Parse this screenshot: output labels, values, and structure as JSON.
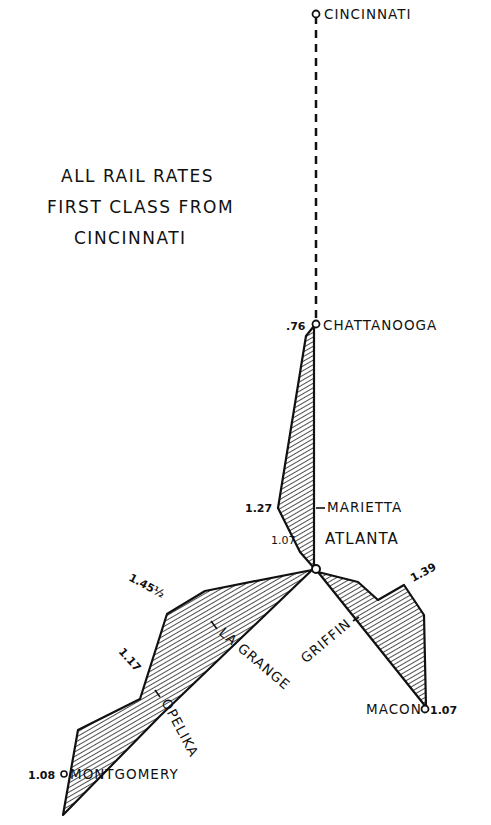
{
  "title": {
    "lines": [
      "ALL RAIL RATES",
      "FIRST CLASS FROM",
      "CINCINNATI"
    ]
  },
  "cities": {
    "cincinnati": {
      "name": "CINCINNATI"
    },
    "chattanooga": {
      "name": "CHATTANOOGA",
      "rate": ".76"
    },
    "marietta": {
      "name": "MARIETTA",
      "rate": "1.27"
    },
    "atlanta": {
      "name": "ATLANTA",
      "rate": "1.07"
    },
    "la_grange": {
      "name": "LA GRANGE",
      "rate": "1.45½"
    },
    "opelika": {
      "name": "OPELIKA",
      "rate": "1.17"
    },
    "montgomery": {
      "name": "MONTGOMERY",
      "rate": "1.08"
    },
    "griffin": {
      "name": "GRIFFIN",
      "rate": "1.39"
    },
    "macon": {
      "name": "MACON",
      "rate": "1.07"
    }
  },
  "colors": {
    "ink": "#111111",
    "paper": "#ffffff"
  }
}
